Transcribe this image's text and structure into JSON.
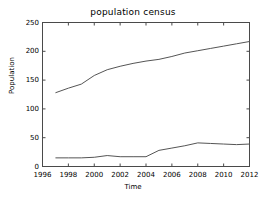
{
  "chart_data": {
    "type": "line",
    "title": "population census",
    "xlabel": "Time",
    "ylabel": "Population",
    "xlim": [
      1996,
      2012
    ],
    "ylim": [
      0,
      250
    ],
    "xticks": [
      1996,
      1998,
      2000,
      2002,
      2004,
      2006,
      2008,
      2010,
      2012
    ],
    "yticks": [
      0,
      50,
      100,
      150,
      200,
      250
    ],
    "grid": false,
    "legend": "none",
    "line_color": "#555555",
    "x": [
      1997,
      1998,
      1999,
      2000,
      2001,
      2002,
      2003,
      2004,
      2005,
      2006,
      2007,
      2008,
      2009,
      2010,
      2011,
      2012
    ],
    "series": [
      {
        "name": "upper",
        "values": [
          128,
          136,
          143,
          158,
          168,
          174,
          179,
          183,
          186,
          191,
          197,
          201,
          205,
          209,
          213,
          217
        ]
      },
      {
        "name": "lower",
        "values": [
          15,
          15,
          15,
          16,
          19,
          17,
          17,
          17,
          28,
          32,
          36,
          41,
          40,
          39,
          38,
          39
        ]
      }
    ]
  },
  "axis": {
    "xtick_labels": [
      "1996",
      "1998",
      "2000",
      "2002",
      "2004",
      "2006",
      "2008",
      "2010",
      "2012"
    ],
    "ytick_labels": [
      "0",
      "50",
      "100",
      "150",
      "200",
      "250"
    ]
  }
}
